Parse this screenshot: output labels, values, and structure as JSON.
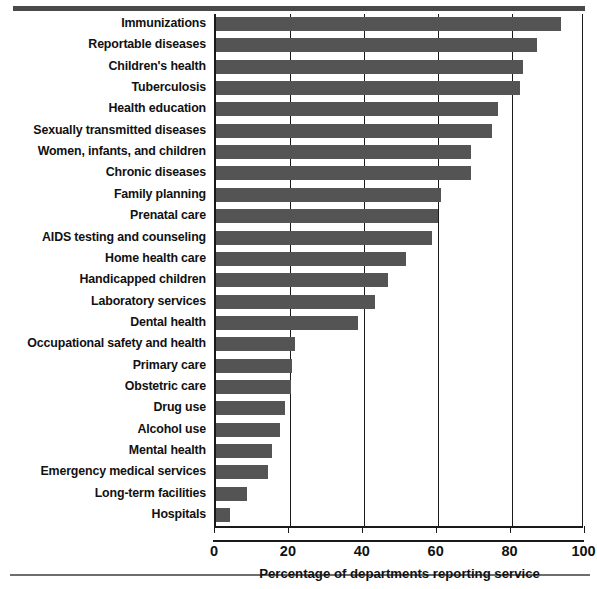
{
  "chart_data": {
    "type": "bar",
    "orientation": "horizontal",
    "title": "",
    "xlabel": "Percentage of departments reporting service",
    "ylabel": "",
    "xlim": [
      0,
      100
    ],
    "xticks": [
      0,
      20,
      40,
      60,
      80,
      100
    ],
    "xtick_labels": [
      "0",
      "20",
      "40",
      "60",
      "80",
      "100"
    ],
    "grid": "vertical",
    "legend": "none",
    "bar_color": "#545454",
    "axis_color": "#1a1a1a",
    "categories": [
      "Immunizations",
      "Reportable diseases",
      "Children's health",
      "Tuberculosis",
      "Health education",
      "Sexually transmitted diseases",
      "Women, infants, and children",
      "Chronic diseases",
      "Family planning",
      "Prenatal care",
      "AIDS testing and counseling",
      "Home health care",
      "Handicapped children",
      "Laboratory services",
      "Dental health",
      "Occupational safety and health",
      "Primary care",
      "Obstetric care",
      "Drug use",
      "Alcohol use",
      "Mental health",
      "Emergency medical services",
      "Long-term facilities",
      "Hospitals"
    ],
    "values": [
      93.5,
      86.8,
      83.1,
      82.3,
      76.4,
      74.6,
      69.1,
      68.9,
      60.9,
      60.0,
      58.4,
      51.4,
      46.6,
      42.9,
      38.5,
      21.3,
      20.7,
      20.3,
      18.7,
      17.3,
      15.1,
      14.0,
      8.5,
      3.7
    ]
  }
}
